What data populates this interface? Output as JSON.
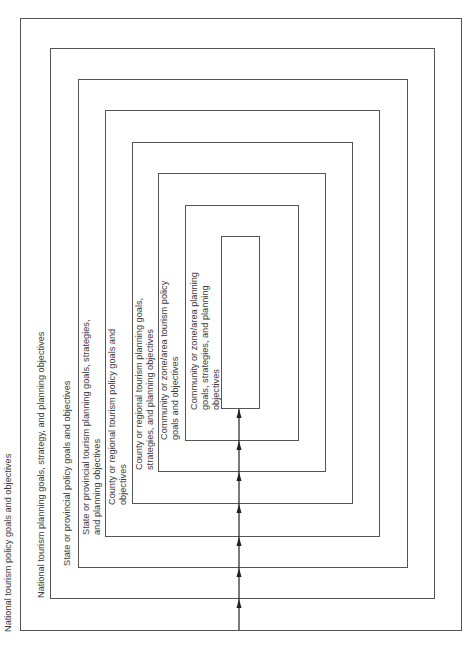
{
  "diagram": {
    "boxes": [
      {
        "id": 1,
        "left": 20,
        "top": 18,
        "right": 461,
        "bottom": 630
      },
      {
        "id": 2,
        "left": 50,
        "top": 48,
        "right": 434,
        "bottom": 598
      },
      {
        "id": 3,
        "left": 78,
        "top": 79,
        "right": 407,
        "bottom": 567
      },
      {
        "id": 4,
        "left": 105,
        "top": 110,
        "right": 379,
        "bottom": 536
      },
      {
        "id": 5,
        "left": 132,
        "top": 142,
        "right": 352,
        "bottom": 503
      },
      {
        "id": 6,
        "left": 158,
        "top": 173,
        "right": 325,
        "bottom": 471
      },
      {
        "id": 7,
        "left": 185,
        "top": 205,
        "right": 298,
        "bottom": 440
      },
      {
        "id": 8,
        "left": 221,
        "top": 236,
        "right": 259,
        "bottom": 408
      }
    ],
    "labels": [
      {
        "lines": [
          "National tourism policy goals and objectives"
        ]
      },
      {
        "lines": [
          "National tourism planning goals, strategy, and planning objectives"
        ]
      },
      {
        "lines": [
          "State or provincial policy goals and objectives"
        ]
      },
      {
        "lines": [
          "State or provincial tourism planning goals, strategies,",
          "and planning objectives"
        ]
      },
      {
        "lines": [
          "County or regional tourism policy goals and",
          "objectives"
        ]
      },
      {
        "lines": [
          "County or regional tourism planning goals,",
          "strategies, and planning objectives"
        ]
      },
      {
        "lines": [
          "Community or zone/area tourism policy",
          "goals and objectives"
        ]
      },
      {
        "lines": [
          "Community or zone/area planning",
          "goals, strategies, and planning",
          "objectives"
        ]
      }
    ],
    "flow": {
      "direction": "upward",
      "x": 239,
      "from_y": 630,
      "to_y": 408,
      "arrowheads_at": [
        598,
        567,
        536,
        503,
        471,
        440,
        408
      ]
    },
    "colors": {
      "line": "#555555",
      "text": "#3a3a3a",
      "arrow": "#222222"
    }
  }
}
